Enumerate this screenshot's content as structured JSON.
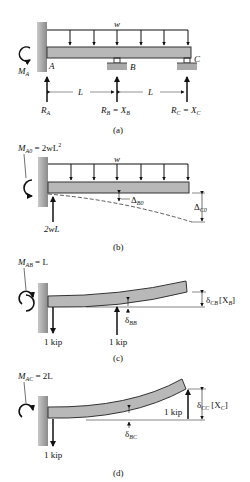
{
  "colors": {
    "beam_fill": "#b8b8b8",
    "beam_stroke": "#333333",
    "wall_fill": "#9a9a9a",
    "ink": "#111111"
  },
  "panel_a": {
    "caption": "(a)",
    "load_label": "w",
    "moment_label": "M",
    "moment_sub": "A",
    "point_A": "A",
    "point_B": "B",
    "point_C": "C",
    "span1": "L",
    "span2": "L",
    "reaction_A": "R",
    "reaction_A_sub": "A",
    "reaction_B": "R",
    "reaction_B_sub": "B",
    "reaction_B_eq": " = X",
    "reaction_B_eq_sub": "B",
    "reaction_C": "R",
    "reaction_C_sub": "C",
    "reaction_C_eq": " = X",
    "reaction_C_eq_sub": "C"
  },
  "panel_b": {
    "caption": "(b)",
    "moment_label": "M",
    "moment_sub": "A0",
    "moment_value": " = 2wL",
    "moment_sup": "2",
    "load_label": "w",
    "reaction": "2wL",
    "defl_B": "Δ",
    "defl_B_sub": "B0",
    "defl_C": "Δ",
    "defl_C_sub": "C0"
  },
  "panel_c": {
    "caption": "(c)",
    "moment_label": "M",
    "moment_sub": "AB",
    "moment_value": " = L",
    "force_A": "1 kip",
    "force_B": "1 kip",
    "defl_BB": "δ",
    "defl_BB_sub": "BB",
    "defl_CB": "δ",
    "defl_CB_sub": "CB",
    "defl_CB_bracket": "[X",
    "defl_CB_bracket_sub": "B",
    "defl_CB_close": "]"
  },
  "panel_d": {
    "caption": "(d)",
    "moment_label": "M",
    "moment_sub": "AC",
    "moment_value": " = 2L",
    "force_A": "1 kip",
    "force_C": "1 kip",
    "defl_BC": "δ",
    "defl_BC_sub": "BC",
    "defl_CC": "δ",
    "defl_CC_sub": "CC",
    "defl_CC_bracket": "[X",
    "defl_CC_bracket_sub": "C",
    "defl_CC_close": "]"
  }
}
